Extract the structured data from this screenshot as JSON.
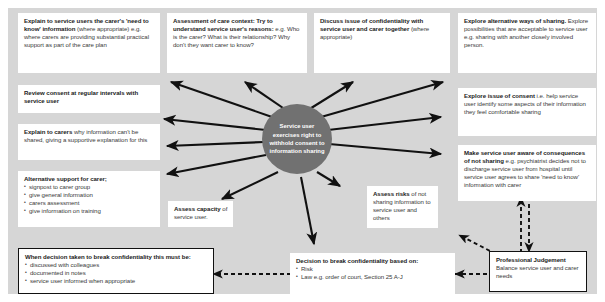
{
  "diagram": {
    "title": "Service user exercises right to withhold consent to information sharing",
    "hub": {
      "label": "Service user exercises right to withhold consent to information sharing"
    },
    "colors": {
      "background": "#d6d6d6",
      "hub_fill": "#717171",
      "box_fill": "#ffffff",
      "arrow": "#111111",
      "text": "#1c1c1c"
    },
    "boxes": [
      {
        "id": "explain-need-to-know",
        "bold_lead": "Explain to service users the carer's 'need to know' information",
        "body": " (where appropriate) e.g. where carers are providing substantial practical support as part of the care plan"
      },
      {
        "id": "assessment-care-context",
        "bold_lead": "Assessment of care context: Try to understand service user's reasons:",
        "body": " e.g. Who is the carer? What is their relationship? Why don't they want carer to know?"
      },
      {
        "id": "discuss-confidentiality",
        "bold_lead": "Discuss issue of confidentiality with service user and carer together",
        "body": " (where appropriate)"
      },
      {
        "id": "explore-alternative-sharing",
        "bold_lead": "Explore alternative ways of sharing.",
        "body": " Explore possibilities that are acceptable to service user e.g. sharing with another closely involved person."
      },
      {
        "id": "review-consent",
        "bold_lead": "Review consent at regular intervals with service user",
        "body": ""
      },
      {
        "id": "explain-to-carers",
        "bold_lead": "Explain to carers",
        "body": " why information can't be shared, giving a supportive explanation for this"
      },
      {
        "id": "explore-consent",
        "bold_lead": "Explore issue of consent",
        "body": " i.e. help service user identify some aspects of their information they feel comfortable sharing"
      },
      {
        "id": "consequences-not-sharing",
        "bold_lead": "Make service user aware of consequences of not sharing",
        "body": " e.g. psychiatrist decides not to discharge service user from hospital until service user agrees to share 'need to know' information with carer"
      },
      {
        "id": "assess-capacity",
        "bold_lead": "Assess capacity",
        "body": " of service user."
      },
      {
        "id": "assess-risks",
        "bold_lead": "Assess risks",
        "body": " of not sharing information to service user and others"
      },
      {
        "id": "professional-judgement",
        "bold_lead": "Professional Judgement",
        "body": "Balance service user and carer needs"
      }
    ],
    "alternative_support": {
      "heading": "Alternative support for carer;",
      "items": [
        "signpost to carer group",
        "give general information",
        "carers assessment",
        "give information on training"
      ]
    },
    "break_confidentiality_requirements": {
      "heading": "When decision taken to break confidentiality this must be:",
      "items": [
        "discussed with colleagues",
        "documented in notes",
        "service user informed when appropriate"
      ]
    },
    "decision_basis": {
      "heading": "Decision to break confidentiality based on:",
      "items": [
        "Risk",
        "Law e.g. order of court, Section 25 A-J"
      ]
    }
  }
}
